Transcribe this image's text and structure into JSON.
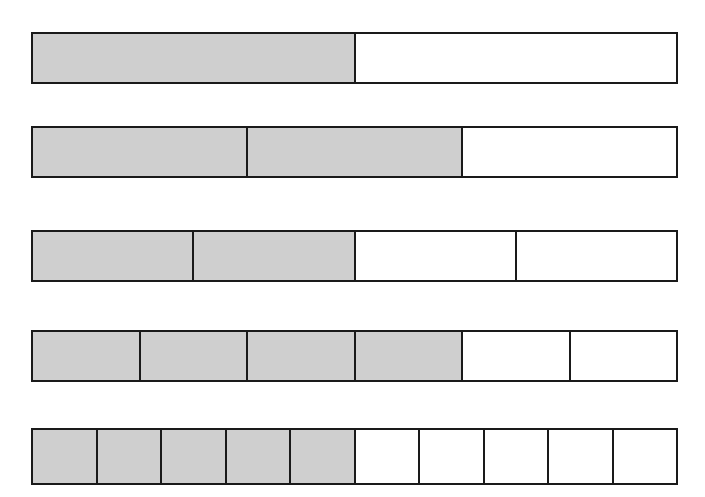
{
  "figure": {
    "background_color": "#ffffff",
    "shaded_color": "#cfcfcf",
    "unshaded_color": "#ffffff",
    "border_color": "#1a1a1a",
    "bars": [
      {
        "name": "bar-one-half",
        "fraction": "1/2",
        "numerator": 1,
        "denominator": 2,
        "shaded_cells": 1,
        "total_cells": 2,
        "x": 31,
        "y": 32,
        "width": 647,
        "height": 52
      },
      {
        "name": "bar-two-thirds",
        "fraction": "2/3",
        "numerator": 2,
        "denominator": 3,
        "shaded_cells": 2,
        "total_cells": 3,
        "x": 31,
        "y": 126,
        "width": 647,
        "height": 52
      },
      {
        "name": "bar-two-fourths",
        "fraction": "2/4",
        "numerator": 2,
        "denominator": 4,
        "shaded_cells": 2,
        "total_cells": 4,
        "x": 31,
        "y": 230,
        "width": 647,
        "height": 52
      },
      {
        "name": "bar-four-sixths",
        "fraction": "4/6",
        "numerator": 4,
        "denominator": 6,
        "shaded_cells": 4,
        "total_cells": 6,
        "x": 31,
        "y": 330,
        "width": 647,
        "height": 52
      },
      {
        "name": "bar-five-tenths",
        "fraction": "5/10",
        "numerator": 5,
        "denominator": 10,
        "shaded_cells": 5,
        "total_cells": 10,
        "x": 31,
        "y": 428,
        "width": 647,
        "height": 57
      }
    ]
  },
  "chart_data": {
    "type": "bar",
    "subtitle": "",
    "xlabel": "",
    "ylabel": "",
    "orientation": "horizontal",
    "grid": false,
    "legend": "none",
    "categories": [
      "1/2",
      "2/3",
      "2/4",
      "4/6",
      "5/10"
    ],
    "values": [
      0.5,
      0.6667,
      0.5,
      0.6667,
      0.5
    ],
    "series": [
      {
        "name": "Shaded parts",
        "values": [
          1,
          2,
          2,
          4,
          5
        ]
      },
      {
        "name": "Total parts",
        "values": [
          2,
          3,
          4,
          6,
          10
        ]
      }
    ],
    "annotations": [
      "Each bar is the same total length (whole).",
      "Row 1: 1 of 2 parts shaded = 1/2",
      "Row 2: 2 of 3 parts shaded = 2/3",
      "Row 3: 2 of 4 parts shaded = 2/4",
      "Row 4: 4 of 6 parts shaded = 4/6",
      "Row 5: 5 of 10 parts shaded = 5/10"
    ]
  }
}
